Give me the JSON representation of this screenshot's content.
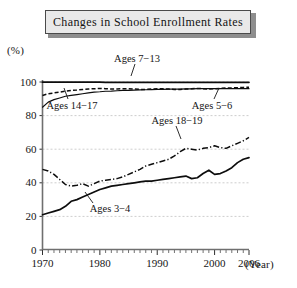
{
  "title": {
    "text": "Changes in School Enrollment Rates"
  },
  "axes": {
    "y_unit_label": "(%)",
    "x_unit_label": "(Year)",
    "y_ticks": [
      "0",
      "20",
      "40",
      "60",
      "80",
      "100"
    ],
    "x_ticks": [
      "1970",
      "1980",
      "1990",
      "2000",
      "2006"
    ]
  },
  "series_labels": {
    "ages_7_13": "Ages 7−13",
    "ages_14_17": "Ages 14−17",
    "ages_5_6": "Ages 5−6",
    "ages_18_19": "Ages 18−19",
    "ages_3_4": "Ages 3−4"
  },
  "chart_data": {
    "type": "line",
    "title": "Changes in School Enrollment Rates",
    "xlabel": "(Year)",
    "ylabel": "(%)",
    "xlim": [
      1970,
      2006
    ],
    "ylim": [
      0,
      100
    ],
    "grid": true,
    "legend": "inline-annotations",
    "x": [
      1970,
      1971,
      1972,
      1973,
      1974,
      1975,
      1976,
      1977,
      1978,
      1979,
      1980,
      1981,
      1982,
      1983,
      1984,
      1985,
      1986,
      1987,
      1988,
      1989,
      1990,
      1991,
      1992,
      1993,
      1994,
      1995,
      1996,
      1997,
      1998,
      1999,
      2000,
      2001,
      2002,
      2003,
      2004,
      2005,
      2006
    ],
    "series": [
      {
        "name": "Ages 7−13",
        "style": "solid",
        "values": [
          99.9,
          99.9,
          99.9,
          99.9,
          99.9,
          99.9,
          99.9,
          99.9,
          99.9,
          99.9,
          99.9,
          99.8,
          99.8,
          99.8,
          99.8,
          99.8,
          99.8,
          99.8,
          99.8,
          99.8,
          99.8,
          99.8,
          99.8,
          99.8,
          99.8,
          99.8,
          99.8,
          99.8,
          99.8,
          99.8,
          99.8,
          99.8,
          99.8,
          99.8,
          99.8,
          99.8,
          99.8
        ]
      },
      {
        "name": "Ages 5−6",
        "style": "solid-thin",
        "values": [
          85.0,
          88.0,
          89.5,
          90.5,
          91.5,
          92.0,
          92.5,
          93.0,
          93.5,
          94.0,
          94.2,
          94.5,
          94.6,
          94.8,
          95.0,
          95.0,
          95.2,
          95.3,
          95.4,
          95.5,
          95.6,
          95.6,
          95.7,
          95.8,
          95.8,
          95.9,
          95.9,
          96.0,
          96.0,
          96.0,
          96.0,
          96.0,
          96.0,
          96.0,
          96.0,
          96.0,
          96.0
        ]
      },
      {
        "name": "Ages 14−17",
        "style": "dashed",
        "values": [
          92.0,
          93.0,
          93.5,
          94.0,
          94.5,
          95.0,
          95.2,
          95.5,
          95.8,
          96.0,
          96.2,
          96.0,
          95.8,
          95.8,
          96.0,
          96.0,
          95.8,
          95.6,
          95.6,
          95.8,
          96.0,
          96.0,
          95.8,
          95.6,
          95.6,
          95.8,
          96.0,
          96.2,
          96.0,
          95.8,
          96.0,
          96.2,
          96.4,
          96.5,
          96.6,
          96.8,
          96.9
        ]
      },
      {
        "name": "Ages 18−19",
        "style": "dash-dot",
        "values": [
          48.0,
          47.0,
          45.0,
          42.0,
          39.0,
          38.0,
          38.5,
          39.5,
          38.0,
          39.5,
          41.0,
          41.5,
          42.0,
          42.5,
          43.5,
          45.0,
          46.5,
          48.0,
          50.0,
          51.0,
          52.0,
          53.0,
          54.0,
          56.0,
          58.5,
          60.5,
          60.0,
          59.5,
          60.5,
          61.0,
          62.0,
          61.0,
          60.5,
          62.0,
          63.5,
          65.0,
          67.0
        ]
      },
      {
        "name": "Ages 3−4",
        "style": "solid",
        "values": [
          21.0,
          22.0,
          23.0,
          24.0,
          26.0,
          29.0,
          30.0,
          31.5,
          33.0,
          34.5,
          36.0,
          37.0,
          38.0,
          38.5,
          39.0,
          39.5,
          40.0,
          40.5,
          41.0,
          41.0,
          41.5,
          42.0,
          42.5,
          43.0,
          43.5,
          44.0,
          42.5,
          43.0,
          45.5,
          47.5,
          45.0,
          45.5,
          47.0,
          49.0,
          52.0,
          54.0,
          55.0
        ]
      }
    ]
  }
}
